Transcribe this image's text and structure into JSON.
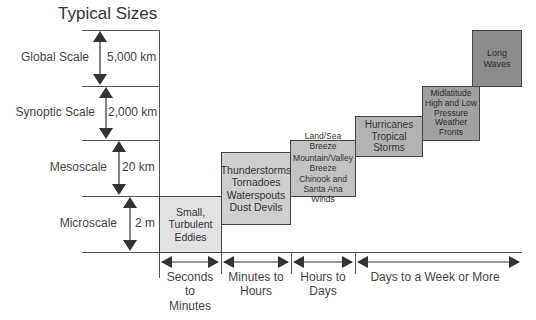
{
  "title": "Typical Sizes",
  "scales": [
    {
      "name": "Global Scale",
      "size": "5,000 km"
    },
    {
      "name": "Synoptic Scale",
      "size": "2,000 km"
    },
    {
      "name": "Mesoscale",
      "size": "20 km"
    },
    {
      "name": "Microscale",
      "size": "2 m"
    }
  ],
  "phenomena": [
    {
      "lines": [
        "Small,",
        "Turbulent",
        "Eddies"
      ],
      "color": "#e3e3e3"
    },
    {
      "lines": [
        "Thunderstorms",
        "Tornadoes",
        "Waterspouts",
        "Dust Devils"
      ],
      "color": "#cfcfcf"
    },
    {
      "lines": [
        "Land/Sea Breeze",
        "Mountain/Valley",
        "Breeze",
        "Chinook and",
        "Santa Ana Winds"
      ],
      "color": "#c2c2c2"
    },
    {
      "lines": [
        "Hurricanes",
        "Tropical Storms"
      ],
      "color": "#b3b3b3"
    },
    {
      "lines": [
        "Midlatitude",
        "High and Low",
        "Pressure",
        "Weather Fronts"
      ],
      "color": "#a0a0a0"
    },
    {
      "lines": [
        "Long",
        "Waves"
      ],
      "color": "#8c8c8c"
    }
  ],
  "time_scales": [
    {
      "lines": [
        "Seconds",
        "to",
        "Minutes"
      ]
    },
    {
      "lines": [
        "Minutes to",
        "Hours"
      ]
    },
    {
      "lines": [
        "Hours to",
        "Days"
      ]
    },
    {
      "lines": [
        "Days to a Week or More"
      ]
    }
  ]
}
